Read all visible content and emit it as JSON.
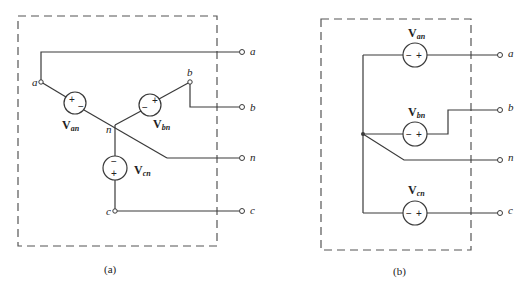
{
  "figure": {
    "panels": [
      {
        "id": "a",
        "caption": "(a)",
        "configuration": "wye (Y) connected three-phase sources",
        "sources": [
          {
            "name": "V",
            "sub": "an",
            "polarity_top": "+",
            "polarity_bottom": "−"
          },
          {
            "name": "V",
            "sub": "bn",
            "polarity_left": "−",
            "polarity_right": "+"
          },
          {
            "name": "V",
            "sub": "cn",
            "polarity_top": "−",
            "polarity_bottom": "+"
          }
        ],
        "internal_nodes": {
          "a": "a",
          "b": "b",
          "n": "n",
          "c": "c"
        },
        "terminals": [
          "a",
          "b",
          "n",
          "c"
        ]
      },
      {
        "id": "b",
        "caption": "(b)",
        "configuration": "equivalent redrawn wye sources",
        "sources": [
          {
            "name": "V",
            "sub": "an",
            "polarity_left": "−",
            "polarity_right": "+"
          },
          {
            "name": "V",
            "sub": "bn",
            "polarity_left": "−",
            "polarity_right": "+"
          },
          {
            "name": "V",
            "sub": "cn",
            "polarity_left": "−",
            "polarity_right": "+"
          }
        ],
        "terminals": [
          "a",
          "b",
          "n",
          "c"
        ]
      }
    ]
  },
  "signs": {
    "plus": "+",
    "minus": "−"
  }
}
